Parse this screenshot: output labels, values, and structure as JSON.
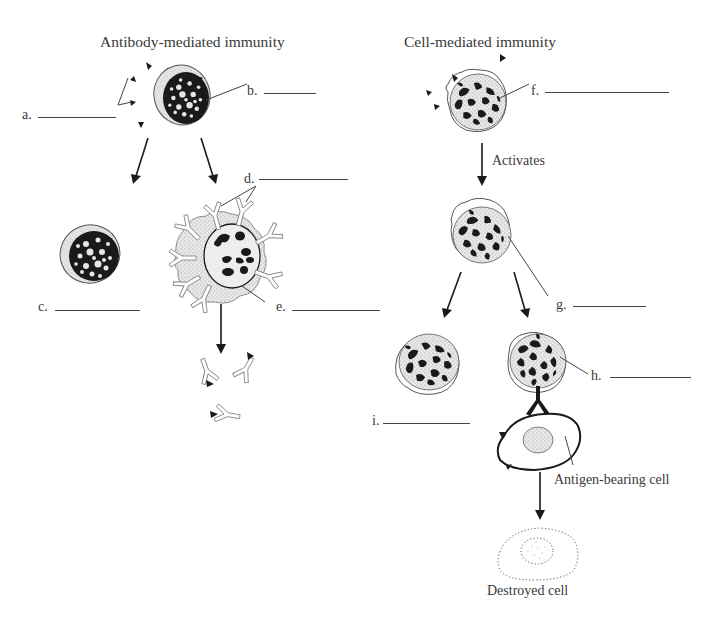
{
  "diagram": {
    "titles": {
      "left": "Antibody-mediated immunity",
      "right": "Cell-mediated immunity"
    },
    "labels": {
      "a": "a.",
      "b": "b.",
      "c": "c.",
      "d": "d.",
      "e": "e.",
      "f": "f.",
      "g": "g.",
      "h": "h.",
      "i": "i."
    },
    "annotations": {
      "activates": "Activates",
      "antigen_bearing_cell": "Antigen-bearing cell",
      "destroyed_cell": "Destroyed cell"
    },
    "blank_answers": {
      "a": "",
      "b": "",
      "c": "",
      "d": "",
      "e": "",
      "f": "",
      "g": "",
      "h": "",
      "i": ""
    },
    "colors": {
      "ink": "#1a1a1a",
      "cytoplasm": "#d9d9d9",
      "nucleus_light": "#e6e6e6",
      "line": "#444444"
    }
  }
}
